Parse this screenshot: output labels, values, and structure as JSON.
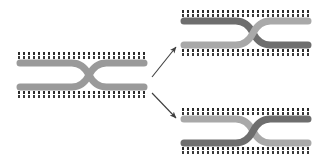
{
  "diagram": {
    "background_color": "#ffffff",
    "canvas": {
      "width": 318,
      "height": 164
    },
    "palette": {
      "arm_medium_gray": "#9a9a9a",
      "arm_dark_gray": "#6e6e6e",
      "arm_light_gray": "#b0b0b0",
      "dot_color": "#2b2b2b",
      "arrow_color": "#3d3d3d"
    },
    "dot_rail": {
      "dash_length_px": 2,
      "gap_length_px": 3,
      "thickness_px": 3,
      "rows_per_rail": 2
    }
  },
  "chromosomes": [
    {
      "id": "parent",
      "role": "parent-chromosome-pair",
      "label": "parent chromosome pair",
      "x": 18,
      "y": 50,
      "width": 128,
      "height": 52,
      "crossover": true,
      "top_arm_color": "#9a9a9a",
      "bottom_arm_color": "#9a9a9a",
      "top_rail_y": 2,
      "bottom_rail_y": 41,
      "arm_thickness": 7
    },
    {
      "id": "recombinant-top",
      "role": "recombinant-chromosome-pair-top",
      "label": "recombinant chromosome pair (top)",
      "x": 182,
      "y": 8,
      "width": 128,
      "height": 52,
      "crossover": true,
      "top_arm_color": "#6e6e6e",
      "bottom_arm_color": "#a9a9a9",
      "top_rail_y": 2,
      "bottom_rail_y": 41,
      "arm_thickness": 7
    },
    {
      "id": "recombinant-bottom",
      "role": "recombinant-chromosome-pair-bottom",
      "label": "recombinant chromosome pair (bottom)",
      "x": 182,
      "y": 106,
      "width": 128,
      "height": 52,
      "crossover": true,
      "top_arm_color": "#a9a9a9",
      "bottom_arm_color": "#6e6e6e",
      "top_rail_y": 2,
      "bottom_rail_y": 41,
      "arm_thickness": 7
    }
  ],
  "arrows": [
    {
      "id": "arrow-up",
      "label": "arrow to top recombinant pair",
      "from_x": 152,
      "from_y": 77,
      "to_x": 176,
      "to_y": 47,
      "color": "#3d3d3d"
    },
    {
      "id": "arrow-down",
      "label": "arrow to bottom recombinant pair",
      "from_x": 152,
      "from_y": 93,
      "to_x": 176,
      "to_y": 118,
      "color": "#3d3d3d"
    }
  ]
}
